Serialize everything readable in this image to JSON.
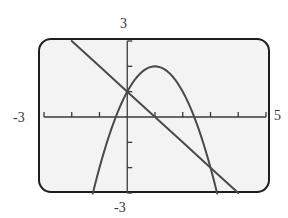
{
  "window": {
    "xmin": "-3",
    "xmax": "5",
    "ymin": "-3",
    "ymax": "3"
  },
  "chart_data": {
    "type": "line",
    "title": "",
    "xlabel": "",
    "ylabel": "",
    "xlim": [
      -3,
      5
    ],
    "ylim": [
      -3,
      3
    ],
    "x_tick_step": 1,
    "y_tick_step": 1,
    "grid": false,
    "series": [
      {
        "name": "line y = -x + 1",
        "x": [
          -2,
          -1,
          0,
          1,
          2,
          3,
          4
        ],
        "y": [
          3,
          2,
          1,
          0,
          -1,
          -2,
          -3
        ]
      },
      {
        "name": "parabola y = -x^2 + 2x + 1",
        "x": [
          -1.24,
          -1,
          -0.5,
          -0.41,
          0,
          0.5,
          1,
          1.5,
          2,
          2.41,
          2.5,
          3,
          3.24
        ],
        "y": [
          -3,
          -2,
          -0.25,
          0,
          1,
          1.75,
          2,
          1.75,
          1,
          0,
          -0.25,
          -2,
          -3
        ]
      }
    ],
    "annotations": [
      "intersection (0, 1)",
      "intersection (3, -2)",
      "vertex (1, 2)"
    ],
    "colors": {
      "curve": "#4a4a4a",
      "axis": "#3a3a3a",
      "frame": "#1e1e1e",
      "screen_bg": "#f3f3f3"
    }
  }
}
